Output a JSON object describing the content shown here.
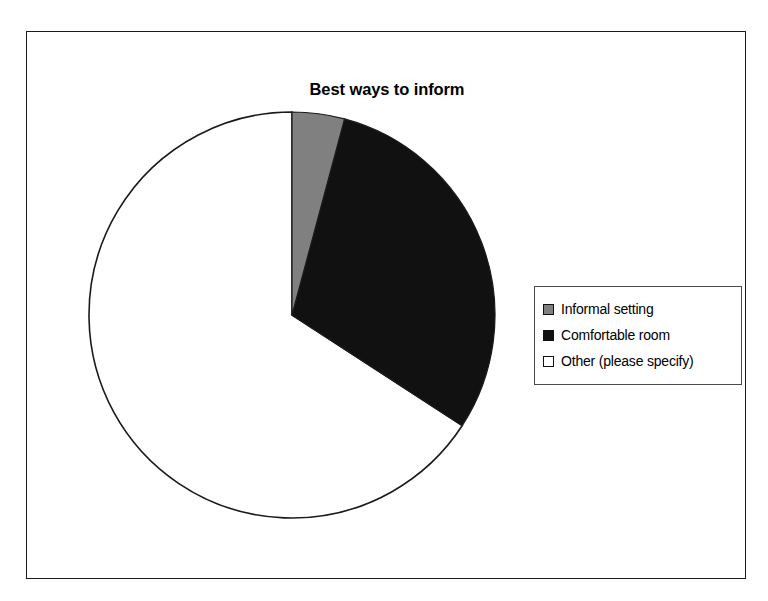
{
  "chart": {
    "title": "Best ways to inform"
  },
  "legend": {
    "items": [
      {
        "label": "Informal setting",
        "color": "#808080",
        "swatch_icon": "square-swatch-gray"
      },
      {
        "label": "Comfortable room",
        "color": "#111111",
        "swatch_icon": "square-swatch-black"
      },
      {
        "label": "Other (please specify)",
        "color": "#ffffff",
        "swatch_icon": "square-swatch-white"
      }
    ]
  },
  "chart_data": {
    "type": "pie",
    "title": "Best ways to inform",
    "xlabel": "",
    "ylabel": "",
    "grid": false,
    "legend_position": "right",
    "start_angle": 0,
    "direction": "clockwise",
    "categories": [
      "Informal setting",
      "Comfortable room",
      "Other (please specify)"
    ],
    "values": [
      15,
      108,
      237
    ],
    "value_unit": "degrees",
    "percentages": [
      4.2,
      30.0,
      65.8
    ],
    "colors": [
      "#808080",
      "#111111",
      "#ffffff"
    ],
    "slice_edge_color": "#1a1a1a",
    "center": {
      "x": 277,
      "y": 330
    },
    "radius": 196
  }
}
